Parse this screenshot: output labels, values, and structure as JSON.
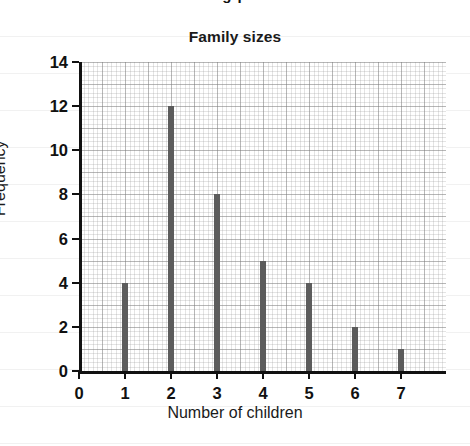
{
  "page": {
    "top_cropped_text": "g  p"
  },
  "chart_data": {
    "type": "bar",
    "title": "Family sizes",
    "xlabel": "Number of children",
    "ylabel": "Frequency",
    "categories": [
      "0",
      "1",
      "2",
      "3",
      "4",
      "5",
      "6",
      "7"
    ],
    "values": [
      0,
      4,
      12,
      8,
      5,
      4,
      2,
      1
    ],
    "xlim": [
      0,
      7.98
    ],
    "ylim": [
      0,
      14
    ],
    "xticks": [
      "0",
      "1",
      "2",
      "3",
      "4",
      "5",
      "6",
      "7"
    ],
    "yticks": [
      "0",
      "2",
      "4",
      "6",
      "8",
      "10",
      "12",
      "14"
    ],
    "ytick_values": [
      0,
      2,
      4,
      6,
      8,
      10,
      12,
      14
    ],
    "grid": true,
    "grid_style": "fine graph paper, minor lines every 0.2 units, major lines every 0.5 units",
    "legend": false,
    "bar_color": "#5c5c5c",
    "axis_color": "#111111",
    "background_color": "#ffffff"
  }
}
